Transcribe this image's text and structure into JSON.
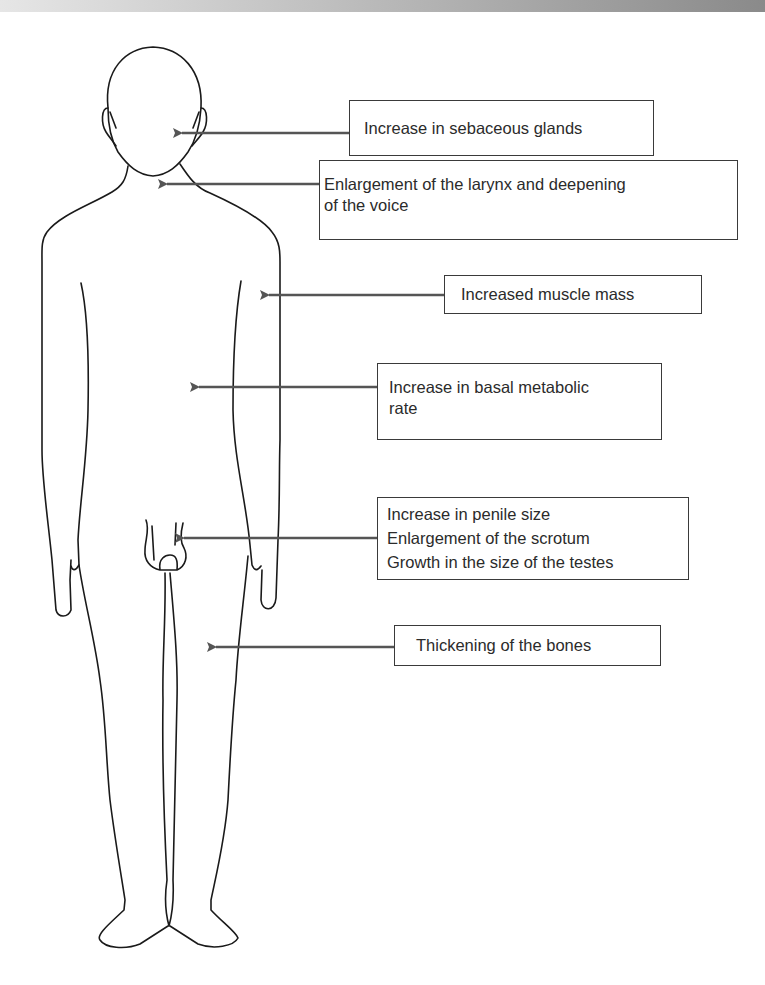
{
  "figure": {
    "colors": {
      "outline": "#1a1a1a",
      "arrow": "#555555",
      "box_border": "#3a3a3a",
      "text": "#2b2b2b",
      "top_bar_start": "#e6e6e6",
      "top_bar_end": "#8a8a8a"
    }
  },
  "labels": [
    {
      "id": "sebaceous",
      "lines": [
        "Increase in sebaceous glands"
      ],
      "target": "face"
    },
    {
      "id": "larynx",
      "lines": [
        "Enlargement of the larynx and deepening",
        "of the voice"
      ],
      "target": "throat"
    },
    {
      "id": "muscle",
      "lines": [
        "Increased muscle mass"
      ],
      "target": "arm"
    },
    {
      "id": "bmr",
      "lines": [
        "Increase in basal metabolic",
        "rate"
      ],
      "target": "torso"
    },
    {
      "id": "genital",
      "lines": [
        "Increase in penile size",
        "Enlargement of the scrotum",
        "Growth in the size of the testes"
      ],
      "target": "genitals"
    },
    {
      "id": "bones",
      "lines": [
        "Thickening of the bones"
      ],
      "target": "leg"
    }
  ]
}
